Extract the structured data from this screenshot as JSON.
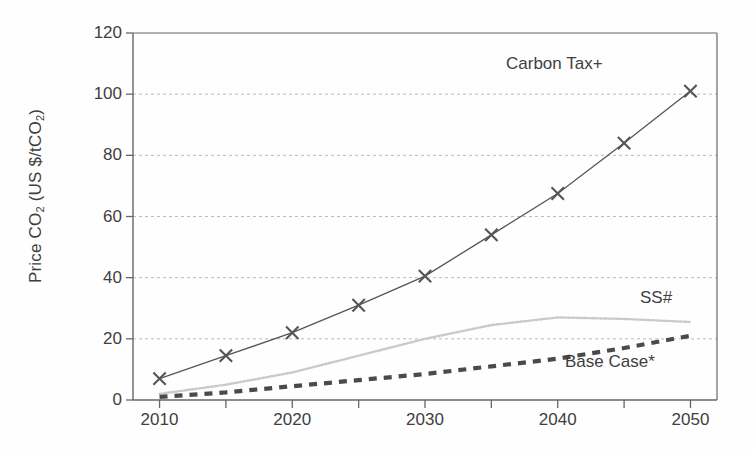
{
  "chart_data": {
    "type": "line",
    "title": "",
    "xlabel": "",
    "ylabel": "Price CO2 (US $/tCO2)",
    "ylabel_parts": {
      "prefix": "Price CO",
      "sub1": "2",
      "middle": " (US $/tCO",
      "sub2": "2",
      "suffix": ")"
    },
    "x": [
      2010,
      2015,
      2020,
      2025,
      2030,
      2035,
      2040,
      2045,
      2050
    ],
    "xlim": [
      2008,
      2052
    ],
    "ylim": [
      0,
      120
    ],
    "yticks": [
      0,
      20,
      40,
      60,
      80,
      100,
      120
    ],
    "xticks": [
      2010,
      2020,
      2030,
      2040,
      2050
    ],
    "xticks_minor": [
      2015,
      2025,
      2035,
      2045
    ],
    "xtick_labels": [
      "2010",
      "2020",
      "2030",
      "2040",
      "2050"
    ],
    "ytick_labels": [
      "0",
      "20",
      "40",
      "60",
      "80",
      "100",
      "120"
    ],
    "grid": "horizontal-dotted",
    "legend": "inline-labels",
    "series": [
      {
        "name": "Carbon Tax+",
        "label": "Carbon Tax+",
        "marker": "x",
        "style": "solid",
        "color": "#555555",
        "values": [
          7,
          14.5,
          22,
          31,
          40.5,
          54,
          67.5,
          84,
          101
        ]
      },
      {
        "name": "SS#",
        "label": "SS#",
        "marker": "none",
        "style": "dotted-light",
        "color": "#c9c9c9",
        "values": [
          2,
          5,
          9,
          14.5,
          20,
          24.5,
          27,
          26.5,
          25.5
        ]
      },
      {
        "name": "Base Case*",
        "label": "Base Case*",
        "marker": "none",
        "style": "dashed-thick",
        "color": "#4a4a4a",
        "values": [
          1,
          2.5,
          4.5,
          6.5,
          8.5,
          11,
          13.5,
          17,
          21
        ]
      }
    ]
  },
  "colors": {
    "axis": "#666666",
    "grid": "#bbbbbb",
    "text": "#3f3f3f",
    "carbon_tax": "#555555",
    "ss": "#c9c9c9",
    "base_case": "#4a4a4a"
  }
}
